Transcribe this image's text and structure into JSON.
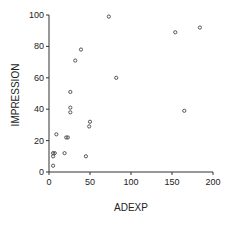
{
  "chart_data": {
    "type": "scatter",
    "title": "",
    "xlabel": "ADEXP",
    "ylabel": "IMPRESSION",
    "xlim": [
      0,
      200
    ],
    "ylim": [
      0,
      100
    ],
    "xticks": [
      0,
      50,
      100,
      150,
      200
    ],
    "yticks": [
      0,
      20,
      40,
      60,
      80,
      100
    ],
    "grid": false,
    "legend": null,
    "marker": "open-circle",
    "points": [
      {
        "x": 73,
        "y": 99
      },
      {
        "x": 39,
        "y": 78
      },
      {
        "x": 32,
        "y": 71
      },
      {
        "x": 82,
        "y": 60
      },
      {
        "x": 26,
        "y": 51
      },
      {
        "x": 26,
        "y": 41
      },
      {
        "x": 26,
        "y": 38
      },
      {
        "x": 50,
        "y": 32
      },
      {
        "x": 49,
        "y": 29
      },
      {
        "x": 9,
        "y": 24
      },
      {
        "x": 21,
        "y": 22
      },
      {
        "x": 23,
        "y": 22
      },
      {
        "x": 5,
        "y": 12
      },
      {
        "x": 7,
        "y": 12
      },
      {
        "x": 5,
        "y": 10
      },
      {
        "x": 19,
        "y": 12
      },
      {
        "x": 45,
        "y": 10
      },
      {
        "x": 5,
        "y": 4
      },
      {
        "x": 154,
        "y": 89
      },
      {
        "x": 184,
        "y": 92
      },
      {
        "x": 165,
        "y": 39
      }
    ]
  }
}
